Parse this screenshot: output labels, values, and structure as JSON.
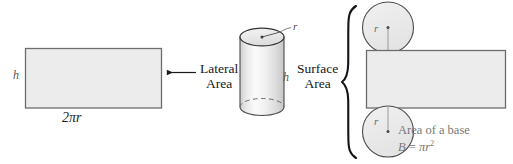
{
  "figure": {
    "background_color": "#ffffff"
  },
  "colors": {
    "shape_fill": "#ececec",
    "shape_stroke": "#6f6f6f",
    "dark_stroke": "#1a1a1a",
    "gray_text": "#777777",
    "label_gray": "#555555",
    "cylinder_light": "#fbfbfb",
    "cylinder_mid": "#e6e6e6",
    "cylinder_dark": "#c9c9c9"
  },
  "left_net": {
    "shape": "rectangle",
    "height_label": "h",
    "width_label": "2πr"
  },
  "lateral": {
    "caption_line1": "Lateral",
    "caption_line2": "Area",
    "arrow": "left-arrow"
  },
  "cylinder": {
    "shape": "cylinder",
    "radius_label": "r",
    "height_label": "h"
  },
  "surface": {
    "caption_line1": "Surface",
    "caption_line2": "Area",
    "brace": "left-curly-brace"
  },
  "right_net": {
    "top_circle_radius_label": "r",
    "bottom_circle_radius_label": "r",
    "rectangle": "lateral-face",
    "base_note_line1": "Area of a base",
    "base_note_formula_lead": "B",
    "base_note_formula_eq": " = ",
    "base_note_formula_pi": "π",
    "base_note_formula_r": "r",
    "base_note_formula_exp": "2"
  }
}
